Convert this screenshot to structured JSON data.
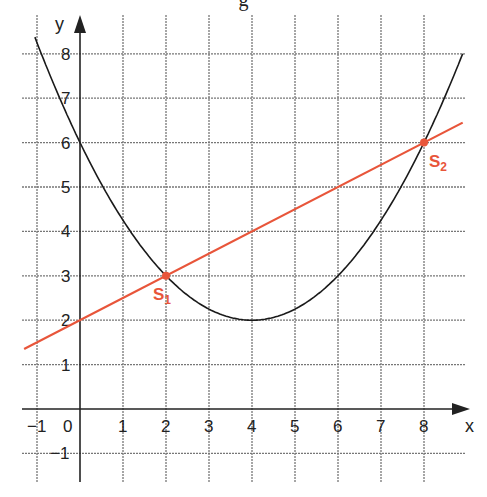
{
  "header": {
    "cropped_text": "g"
  },
  "chart_data": {
    "type": "line",
    "title": "",
    "xlabel": "x",
    "ylabel": "y",
    "xlim": [
      -1.3,
      8.9
    ],
    "ylim": [
      -1.5,
      8.6
    ],
    "grid": true,
    "x_ticks": [
      -1,
      0,
      1,
      2,
      3,
      4,
      5,
      6,
      7,
      8
    ],
    "y_ticks": [
      -1,
      1,
      2,
      3,
      4,
      5,
      6,
      7,
      8
    ],
    "x_tick_labels": [
      "−1",
      "0",
      "1",
      "2",
      "3",
      "4",
      "5",
      "6",
      "7",
      "8"
    ],
    "y_tick_labels": [
      "−1",
      "1",
      "2",
      "3",
      "4",
      "5",
      "6",
      "7",
      "8"
    ],
    "series": [
      {
        "name": "parabola",
        "equation": "y = 0.25(x − 4)² + 2",
        "color": "#1a1a1a",
        "x": [
          -0.6,
          0,
          1,
          2,
          3,
          4,
          5,
          6,
          7,
          8,
          8.5
        ],
        "y": [
          7.29,
          6,
          4.25,
          3,
          2.25,
          2,
          2.25,
          3,
          4.25,
          6,
          7.06
        ]
      },
      {
        "name": "line",
        "equation": "y = 0.5x + 2",
        "color": "#e8553a",
        "x": [
          -1.3,
          8.9
        ],
        "y": [
          1.35,
          6.45
        ]
      }
    ],
    "annotations": [
      {
        "label": "S",
        "subscript": "1",
        "x": 2,
        "y": 3,
        "color": "#e8553a"
      },
      {
        "label": "S",
        "subscript": "2",
        "x": 8,
        "y": 6,
        "color": "#e8553a"
      }
    ]
  }
}
